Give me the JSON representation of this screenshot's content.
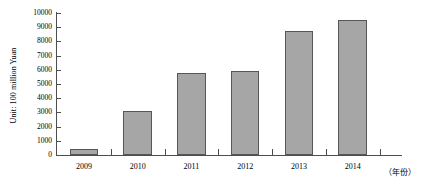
{
  "chart_data": {
    "type": "bar",
    "title": "",
    "subtitle": "",
    "xlabel": "（年份）",
    "ylabel": "Unit: 100 million Yuan",
    "categories": [
      "2009",
      "2010",
      "2011",
      "2012",
      "2013",
      "2014"
    ],
    "values": [
      420,
      3100,
      5800,
      5900,
      8700,
      9500
    ],
    "series": [
      {
        "name": "",
        "values": [
          420,
          3100,
          5800,
          5900,
          8700,
          9500
        ]
      }
    ],
    "ylim": [
      0,
      10000
    ],
    "ytick_labels": [
      "0",
      "1000",
      "2000",
      "3000",
      "4000",
      "5000",
      "6000",
      "7000",
      "8000",
      "9000",
      "10000"
    ],
    "ytick_values": [
      0,
      1000,
      2000,
      3000,
      4000,
      5000,
      6000,
      7000,
      8000,
      9000,
      10000
    ],
    "ytick_step": 1000,
    "grid": false,
    "legend": false,
    "legend_position": "none",
    "bar_color": "#a6a6a6",
    "bar_border_color": "#565656",
    "axis_color": "#4d4d4d",
    "background_color": "#ffffff",
    "annotations": []
  }
}
